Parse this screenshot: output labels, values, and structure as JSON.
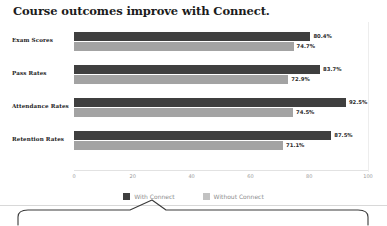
{
  "chart_data": {
    "type": "bar",
    "orientation": "horizontal",
    "title": "Course outcomes improve with Connect.",
    "xlabel": "",
    "ylabel": "",
    "xlim": [
      0,
      100
    ],
    "xticks": [
      0,
      20,
      40,
      60,
      80,
      100
    ],
    "grid": false,
    "legend_position": "bottom-center",
    "categories": [
      "Exam Scores",
      "Pass Rates",
      "Attendance Rates",
      "Retention Rates"
    ],
    "series": [
      {
        "name": "With Connect",
        "color": "#3f3f3f",
        "values": [
          80.4,
          83.7,
          92.5,
          87.5
        ],
        "labels": [
          "80.4%",
          "83.7%",
          "92.5%",
          "87.5%"
        ]
      },
      {
        "name": "Without Connect",
        "color": "#a3a3a3",
        "values": [
          74.7,
          72.9,
          74.5,
          71.1
        ],
        "labels": [
          "74.7%",
          "72.9%",
          "74.5%",
          "71.1%"
        ]
      }
    ]
  },
  "legend": {
    "items": [
      {
        "label": "With Connect",
        "color": "#3f3f3f"
      },
      {
        "label": "Without Connect",
        "color": "#c2c2c2"
      }
    ]
  },
  "axis": {
    "tick_labels": [
      "0",
      "20",
      "40",
      "60",
      "80",
      "100"
    ]
  },
  "callout": {
    "shape": "rounded-rectangle-with-pointer",
    "text": ""
  }
}
